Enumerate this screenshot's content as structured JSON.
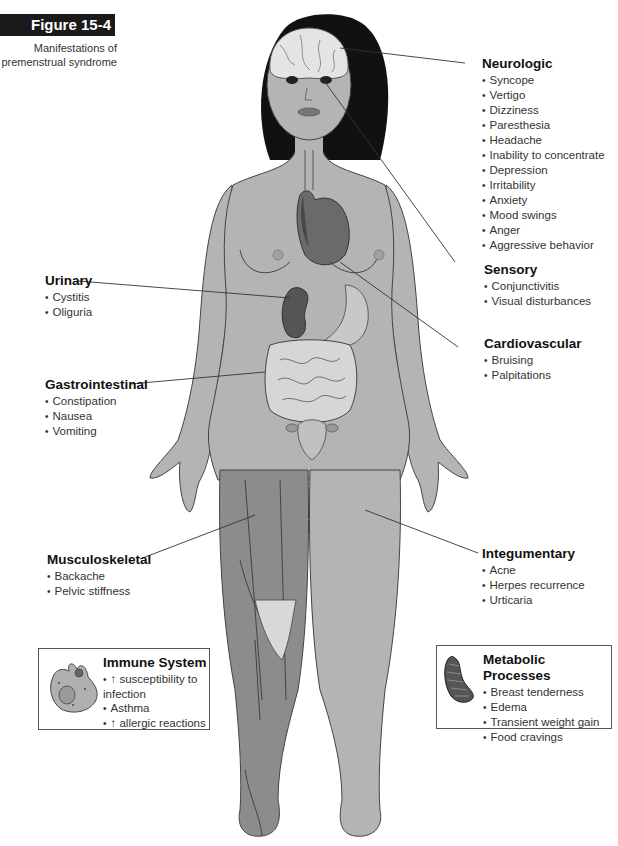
{
  "figure": {
    "tag": "Figure 15-4",
    "caption": "Manifestations of premenstrual syndrome"
  },
  "groups": {
    "neurologic": {
      "title": "Neurologic",
      "items": [
        "Syncope",
        "Vertigo",
        "Dizziness",
        "Paresthesia",
        "Headache",
        "Inability to concentrate",
        "Depression",
        "Irritability",
        "Anxiety",
        "Mood swings",
        "Anger",
        "Aggressive behavior"
      ]
    },
    "sensory": {
      "title": "Sensory",
      "items": [
        "Conjunctivitis",
        "Visual disturbances"
      ]
    },
    "cardiovascular": {
      "title": "Cardiovascular",
      "items": [
        "Bruising",
        "Palpitations"
      ]
    },
    "urinary": {
      "title": "Urinary",
      "items": [
        "Cystitis",
        "Oliguria"
      ]
    },
    "gastrointestinal": {
      "title": "Gastrointestinal",
      "items": [
        "Constipation",
        "Nausea",
        "Vomiting"
      ]
    },
    "musculoskeletal": {
      "title": "Musculoskeletal",
      "items": [
        "Backache",
        "Pelvic stiffness"
      ]
    },
    "integumentary": {
      "title": "Integumentary",
      "items": [
        "Acne",
        "Herpes recurrence",
        "Urticaria"
      ]
    },
    "immune": {
      "title": "Immune System",
      "items": [
        "↑ susceptibility to infection",
        "Asthma",
        "↑ allergic reactions"
      ]
    },
    "metabolic": {
      "title": "Metabolic Processes",
      "items": [
        "Breast tenderness",
        "Edema",
        "Transient weight gain",
        "Food cravings"
      ]
    }
  },
  "colors": {
    "skin": "#b4b4b4",
    "hair": "#111111",
    "organ_dark": "#5a5a5a",
    "organ_mid": "#7a7a7a",
    "intestine": "#d6d6d6",
    "outline": "#444444",
    "label_tag_bg": "#1a1a1a"
  }
}
